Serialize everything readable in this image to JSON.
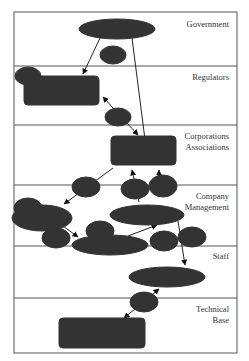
{
  "layers": [
    {
      "id": "government",
      "label_lines": [
        "Government"
      ]
    },
    {
      "id": "regulators",
      "label_lines": [
        "Regulators"
      ]
    },
    {
      "id": "corporations",
      "label_lines": [
        "Corporations",
        "Associations"
      ]
    },
    {
      "id": "company",
      "label_lines": [
        "Company",
        "Management"
      ]
    },
    {
      "id": "staff",
      "label_lines": [
        "Staff"
      ]
    },
    {
      "id": "technical",
      "label_lines": [
        "Technical",
        "Base"
      ]
    }
  ],
  "nodes": {
    "legislators": {
      "label_lines": [
        "Legislators"
      ],
      "shape": "ellipse"
    },
    "national_admin": {
      "label_lines": [
        "National",
        "Administrations"
      ],
      "shape": "rounded-rect"
    },
    "underwriters": {
      "label_lines": [
        "Underwriters",
        "Classifiers"
      ],
      "shape": "rounded-rect"
    },
    "design": {
      "label_lines": [
        "Design"
      ],
      "shape": "ellipse"
    },
    "shipowner": {
      "label_lines": [
        "Shipowner"
      ],
      "shape": "ellipse"
    },
    "shipyard": {
      "label_lines": [
        "Shipyard"
      ],
      "shape": "ellipse"
    },
    "captain": {
      "label_lines": [
        "Captain"
      ],
      "shape": "ellipse"
    },
    "ship_performance": {
      "label_lines": [
        "Ship performance",
        "and limits"
      ],
      "shape": "rounded-rect"
    }
  },
  "links": [
    {
      "number": "1"
    },
    {
      "number": "2"
    },
    {
      "number": "3"
    },
    {
      "number": "4"
    },
    {
      "number": "5"
    },
    {
      "number": "6"
    },
    {
      "number": "7"
    },
    {
      "number": "8"
    },
    {
      "number": "9"
    },
    {
      "number": "10"
    },
    {
      "number": "11"
    },
    {
      "number": "12"
    }
  ],
  "colors": {
    "line": "#444444",
    "text": "#333333",
    "background": "#ffffff"
  }
}
